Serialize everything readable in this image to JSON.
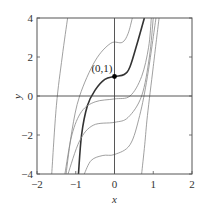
{
  "chart_data": {
    "type": "line",
    "title": "",
    "xlabel": "x",
    "ylabel": "y",
    "xlim": [
      -2,
      2
    ],
    "ylim": [
      -4,
      4
    ],
    "xticks": [
      -2,
      -1,
      0,
      1,
      2
    ],
    "yticks": [
      -4,
      -2,
      0,
      2,
      4
    ],
    "xtick_labels": [
      "−2",
      "−1",
      "0",
      "1",
      "2"
    ],
    "ytick_labels": [
      "−4",
      "−2",
      "0",
      "2",
      "4"
    ],
    "grid": false,
    "reference_lines": {
      "x0": true,
      "y0": true
    },
    "annotation": {
      "label": "(0,1)",
      "x": 0,
      "y": 1
    },
    "series": [
      {
        "name": "solution through (0,1)",
        "bold": true,
        "points": [
          [
            -0.93,
            -4
          ],
          [
            -0.85,
            -2
          ],
          [
            -0.7,
            -0.5
          ],
          [
            -0.5,
            0.3
          ],
          [
            -0.25,
            0.85
          ],
          [
            0,
            1
          ],
          [
            0.25,
            1.1
          ],
          [
            0.4,
            1.5
          ],
          [
            0.6,
            2.8
          ],
          [
            0.77,
            4
          ]
        ]
      },
      {
        "name": "upper curve",
        "points": [
          [
            -1.25,
            -4
          ],
          [
            -1.1,
            -1.8
          ],
          [
            -0.9,
            0
          ],
          [
            -0.5,
            1.8
          ],
          [
            -0.1,
            2.7
          ],
          [
            0.2,
            2.75
          ],
          [
            0.35,
            3.2
          ],
          [
            0.46,
            4
          ]
        ]
      },
      {
        "name": "leftmost curve",
        "points": [
          [
            -1.62,
            -4
          ],
          [
            -1.5,
            -0.5
          ],
          [
            -1.35,
            2
          ],
          [
            -1.21,
            4
          ]
        ]
      },
      {
        "name": "curve plateau -0.2",
        "points": [
          [
            -1.28,
            -4
          ],
          [
            -1.1,
            -2
          ],
          [
            -0.85,
            -0.8
          ],
          [
            -0.5,
            -0.3
          ],
          [
            0,
            -0.15
          ],
          [
            0.4,
            0
          ],
          [
            0.7,
            1
          ],
          [
            0.88,
            2.5
          ],
          [
            0.95,
            4
          ]
        ]
      },
      {
        "name": "curve plateau -1.3",
        "points": [
          [
            -1.2,
            -4
          ],
          [
            -0.9,
            -2.3
          ],
          [
            -0.55,
            -1.5
          ],
          [
            0,
            -1.35
          ],
          [
            0.35,
            -1.1
          ],
          [
            0.7,
            0
          ],
          [
            0.9,
            2
          ],
          [
            1.0,
            4
          ]
        ]
      },
      {
        "name": "curve plateau -3.0",
        "points": [
          [
            -0.78,
            -4
          ],
          [
            -0.6,
            -3.3
          ],
          [
            -0.3,
            -3.05
          ],
          [
            0,
            -3.0
          ],
          [
            0.4,
            -2.5
          ],
          [
            0.65,
            -1
          ],
          [
            0.85,
            1
          ],
          [
            1.07,
            4
          ]
        ]
      },
      {
        "name": "rightmost curve",
        "points": [
          [
            0.7,
            -4
          ],
          [
            0.78,
            -2.5
          ],
          [
            0.85,
            -1
          ],
          [
            1.0,
            1.5
          ],
          [
            1.15,
            4
          ]
        ]
      }
    ]
  }
}
